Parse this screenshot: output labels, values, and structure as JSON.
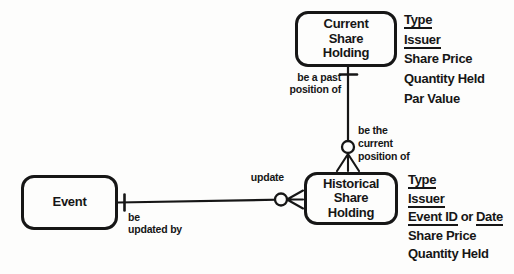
{
  "diagram": {
    "title_hint": "entity-relationship-diagram",
    "colors": {
      "ink": "#161616",
      "paper": "#fdfdfc"
    },
    "entities": {
      "current": {
        "name": "Current\nShare\nHolding",
        "attrs": {
          "a1": "Type",
          "a2": "Issuer",
          "a3": "Share Price",
          "a4": "Quantity Held",
          "a5": "Par Value"
        }
      },
      "historical": {
        "name": "Historical\nShare\nHolding",
        "attrs": {
          "a1": "Type",
          "a2": "Issuer",
          "a3a": "Event ID",
          "a3b": "or",
          "a3c": "Date",
          "a4": "Share Price",
          "a5": "Quantity Held"
        }
      },
      "event": {
        "name": "Event"
      }
    },
    "relationships": {
      "current_historical": {
        "label_near_current": "be a past\nposition of",
        "label_near_historical": "be the\ncurrent\nposition of",
        "cardinality_current_end": "one-bar",
        "cardinality_historical_end": "optional-circle-with-crow-foot"
      },
      "event_historical": {
        "label_near_historical": "update",
        "label_near_event": "be\nupdated by",
        "cardinality_event_end": "one-bar",
        "cardinality_historical_end": "optional-circle-with-crow-foot"
      }
    }
  }
}
